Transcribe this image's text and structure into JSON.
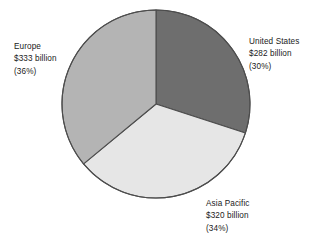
{
  "chart_data": {
    "type": "pie",
    "title": "",
    "subtitle": "",
    "xlabel": "",
    "ylabel": "",
    "legend_position": "none",
    "grid": false,
    "start_angle_deg": 0,
    "direction": "clockwise",
    "categories": [
      "United States",
      "Asia Pacific",
      "Europe"
    ],
    "values": [
      282,
      320,
      333
    ],
    "percentages": [
      30,
      34,
      36
    ],
    "value_unit": "billion",
    "value_prefix": "$",
    "colors": [
      "#6e6e6e",
      "#e6e6e6",
      "#b4b4b4"
    ],
    "slices": [
      {
        "name": "United States",
        "value": 282,
        "percent": 30,
        "color": "#6e6e6e",
        "label_lines": [
          "United States",
          "$282 billion",
          "(30%)"
        ]
      },
      {
        "name": "Asia Pacific",
        "value": 320,
        "percent": 34,
        "color": "#e6e6e6",
        "label_lines": [
          "Asia Pacific",
          "$320 billion",
          "(34%)"
        ]
      },
      {
        "name": "Europe",
        "value": 333,
        "percent": 36,
        "color": "#b4b4b4",
        "label_lines": [
          "Europe",
          "$333 billion",
          "(36%)"
        ]
      }
    ]
  },
  "labels": {
    "united_states": {
      "name": "United States",
      "value": "$282 billion",
      "percent": "(30%)"
    },
    "asia_pacific": {
      "name": "Asia Pacific",
      "value": "$320 billion",
      "percent": "(34%)"
    },
    "europe": {
      "name": "Europe",
      "value": "$333 billion",
      "percent": "(36%)"
    }
  },
  "style": {
    "background": "#ffffff",
    "outline": "#4d4d4d",
    "text": "#1a1a1a"
  }
}
